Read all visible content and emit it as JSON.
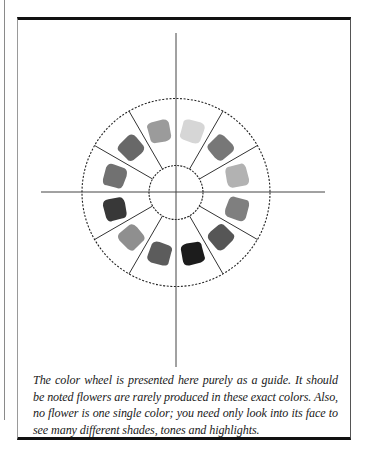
{
  "figure": {
    "segments": 12,
    "swatches": [
      {
        "position": "12:30",
        "tone": "#d6d6d6"
      },
      {
        "position": "1:30",
        "tone": "#777777"
      },
      {
        "position": "2:30",
        "tone": "#b2b2b2"
      },
      {
        "position": "3:30",
        "tone": "#7f7f7f"
      },
      {
        "position": "4:30",
        "tone": "#565656"
      },
      {
        "position": "5:30",
        "tone": "#1c1c1c"
      },
      {
        "position": "6:30",
        "tone": "#5c5c5c"
      },
      {
        "position": "7:30",
        "tone": "#8f8f8f"
      },
      {
        "position": "8:30",
        "tone": "#383838"
      },
      {
        "position": "9:30",
        "tone": "#717171"
      },
      {
        "position": "10:30",
        "tone": "#686868"
      },
      {
        "position": "11:30",
        "tone": "#9b9b9b"
      }
    ]
  },
  "caption": "The color wheel is presented here purely as a guide. It should be noted flowers are rarely produced in these exact colors. Also, no flower is one single color; you need only look into its face to see many different shades, tones and highlights."
}
